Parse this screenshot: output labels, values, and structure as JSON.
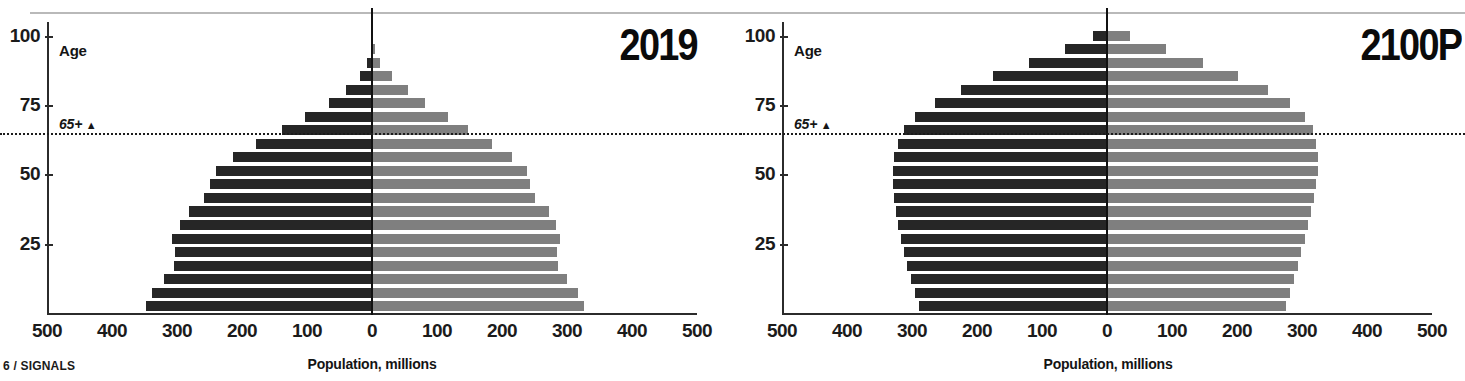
{
  "footer": {
    "label": "6 / SIGNALS"
  },
  "axis": {
    "x_title": "Population, millions",
    "x_ticks": [
      500,
      400,
      300,
      200,
      100,
      0,
      100,
      200,
      300,
      400,
      500
    ],
    "y_ticks": [
      25,
      50,
      75,
      100
    ],
    "age_caption": "Age",
    "reference_label": "65+",
    "reference_marker": "▲",
    "reference_age": 65
  },
  "colors": {
    "male": "#262626",
    "female": "#7f7f7f",
    "axis": "#2b2b2b",
    "rule": "#b9b9b9",
    "text": "#1b1b1b"
  },
  "panels": [
    {
      "id": "panel-2019",
      "title": "2019"
    },
    {
      "id": "panel-2100p",
      "title": "2100P"
    }
  ],
  "chart_data": [
    {
      "type": "bar",
      "subtype": "population-pyramid",
      "title": "2019",
      "xlabel": "Population, millions",
      "ylabel": "Age",
      "xlim": [
        -500,
        500
      ],
      "ylim": [
        0,
        105
      ],
      "grid": false,
      "legend": "none",
      "reference_line": {
        "value": 65,
        "label": "65+",
        "style": "dotted"
      },
      "categories": [
        "0-4",
        "5-9",
        "10-14",
        "15-19",
        "20-24",
        "25-29",
        "30-34",
        "35-39",
        "40-44",
        "45-49",
        "50-54",
        "55-59",
        "60-64",
        "65-69",
        "70-74",
        "75-79",
        "80-84",
        "85-89",
        "90-94",
        "95-99",
        "100+"
      ],
      "series": [
        {
          "name": "Male",
          "side": "left",
          "color": "#262626",
          "values": [
            348,
            339,
            320,
            305,
            303,
            307,
            296,
            282,
            258,
            249,
            240,
            214,
            178,
            138,
            103,
            66,
            40,
            19,
            7,
            2,
            0.4
          ]
        },
        {
          "name": "Female",
          "side": "right",
          "color": "#7f7f7f",
          "values": [
            326,
            317,
            300,
            286,
            285,
            289,
            283,
            272,
            251,
            243,
            238,
            215,
            184,
            148,
            117,
            82,
            55,
            30,
            13,
            4,
            1
          ]
        }
      ]
    },
    {
      "type": "bar",
      "subtype": "population-pyramid",
      "title": "2100P",
      "xlabel": "Population, millions",
      "ylabel": "Age",
      "xlim": [
        -500,
        500
      ],
      "ylim": [
        0,
        105
      ],
      "grid": false,
      "legend": "none",
      "reference_line": {
        "value": 65,
        "label": "65+",
        "style": "dotted"
      },
      "categories": [
        "0-4",
        "5-9",
        "10-14",
        "15-19",
        "20-24",
        "25-29",
        "30-34",
        "35-39",
        "40-44",
        "45-49",
        "50-54",
        "55-59",
        "60-64",
        "65-69",
        "70-74",
        "75-79",
        "80-84",
        "85-89",
        "90-94",
        "95-99",
        "100+"
      ],
      "series": [
        {
          "name": "Male",
          "side": "left",
          "color": "#262626",
          "values": [
            290,
            295,
            302,
            308,
            313,
            317,
            321,
            325,
            328,
            330,
            330,
            328,
            322,
            313,
            295,
            265,
            225,
            175,
            120,
            65,
            22
          ]
        },
        {
          "name": "Female",
          "side": "right",
          "color": "#7f7f7f",
          "values": [
            276,
            281,
            288,
            294,
            299,
            304,
            309,
            314,
            318,
            322,
            324,
            325,
            322,
            317,
            304,
            281,
            247,
            202,
            148,
            90,
            35
          ]
        }
      ]
    }
  ]
}
